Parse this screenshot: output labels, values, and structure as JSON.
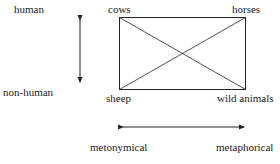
{
  "labels": {
    "human": "human",
    "non_human": "non-human",
    "cows": "cows",
    "horses": "horses",
    "sheep": "sheep",
    "wild_animals": "wild animals",
    "metonymical": "metonymical",
    "metaphorical": "metaphorical"
  },
  "diagram": {
    "vertical_axis": {
      "top": "human",
      "bottom": "non-human",
      "arrows": "both"
    },
    "horizontal_axis": {
      "left": "metonymical",
      "right": "metaphorical",
      "arrows": "both"
    },
    "rectangle_corners": {
      "top_left": "cows",
      "top_right": "horses",
      "bottom_left": "sheep",
      "bottom_right": "wild animals"
    },
    "diagonals": [
      "cows-wild animals",
      "horses-sheep"
    ],
    "line_color": "#222222"
  }
}
